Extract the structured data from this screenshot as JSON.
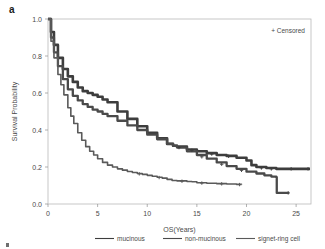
{
  "figure": {
    "panel_label": "a",
    "censored_note": "+ Censored"
  },
  "chart_data": {
    "type": "line",
    "subtype": "kaplan-meier-survival",
    "title": "",
    "xlabel": "OS(Years)",
    "ylabel": "Survival Probability",
    "xlim": [
      0,
      26.5
    ],
    "ylim": [
      0.0,
      1.0
    ],
    "xticks": [
      0,
      5,
      10,
      15,
      20,
      25
    ],
    "xtick_labels": [
      "0",
      "5",
      "10",
      "15",
      "20",
      "25"
    ],
    "yticks": [
      0.0,
      0.2,
      0.4,
      0.6,
      0.8,
      1.0
    ],
    "ytick_labels": [
      "0.0",
      "0.2",
      "0.4",
      "0.6",
      "0.8",
      "1.0"
    ],
    "grid": false,
    "legend_position": "bottom",
    "censor_marker": "+",
    "series": [
      {
        "name": "mucinous",
        "color": "#3d3d3d",
        "x": [
          0,
          0.3,
          0.6,
          1.0,
          1.5,
          2.0,
          2.5,
          3.0,
          3.5,
          4.0,
          4.5,
          5.0,
          5.5,
          6.0,
          7.0,
          8.0,
          9.0,
          10.0,
          11.0,
          12.0,
          12.6,
          13.0,
          14.0,
          15.0,
          16.0,
          17.0,
          18.0,
          19.0,
          20.0,
          20.5,
          21.0,
          22.0,
          23.0,
          24.0,
          25.0,
          26.0,
          26.4
        ],
        "y": [
          1.0,
          0.93,
          0.86,
          0.79,
          0.73,
          0.69,
          0.66,
          0.63,
          0.61,
          0.6,
          0.59,
          0.58,
          0.565,
          0.55,
          0.5,
          0.46,
          0.42,
          0.385,
          0.355,
          0.325,
          0.315,
          0.31,
          0.295,
          0.285,
          0.275,
          0.265,
          0.26,
          0.25,
          0.235,
          0.21,
          0.2,
          0.195,
          0.19,
          0.19,
          0.19,
          0.19,
          0.19
        ]
      },
      {
        "name": "non-mucinous",
        "color": "#4a4a4a",
        "x": [
          0,
          0.3,
          0.6,
          1.0,
          1.5,
          2.0,
          2.5,
          3.0,
          3.5,
          4.0,
          4.5,
          5.0,
          5.5,
          6.0,
          7.0,
          8.0,
          9.0,
          10.0,
          11.0,
          12.0,
          12.6,
          13.0,
          14.0,
          15.0,
          16.0,
          17.0,
          18.0,
          19.0,
          20.0,
          21.0,
          21.8,
          22.5,
          23.0,
          23.05,
          24.0,
          24.3
        ],
        "y": [
          1.0,
          0.9,
          0.82,
          0.745,
          0.675,
          0.62,
          0.585,
          0.56,
          0.54,
          0.525,
          0.51,
          0.5,
          0.487,
          0.475,
          0.45,
          0.425,
          0.4,
          0.375,
          0.35,
          0.325,
          0.315,
          0.305,
          0.285,
          0.265,
          0.245,
          0.225,
          0.205,
          0.19,
          0.175,
          0.165,
          0.155,
          0.148,
          0.145,
          0.06,
          0.06,
          0.06
        ]
      },
      {
        "name": "signet-ring cell",
        "color": "#5a5a5a",
        "x": [
          0,
          0.3,
          0.6,
          1.0,
          1.3,
          1.6,
          2.0,
          2.3,
          2.6,
          3.0,
          3.4,
          3.8,
          4.2,
          4.6,
          5.0,
          5.5,
          6.0,
          6.5,
          7.0,
          7.5,
          8.0,
          8.5,
          9.0,
          9.5,
          10.0,
          10.5,
          11.0,
          11.5,
          12.0,
          12.5,
          13.0,
          14.0,
          14.5,
          15.0,
          16.0,
          17.0,
          18.0,
          19.0,
          19.5
        ],
        "y": [
          1.0,
          0.88,
          0.79,
          0.7,
          0.645,
          0.59,
          0.52,
          0.475,
          0.435,
          0.385,
          0.345,
          0.31,
          0.285,
          0.265,
          0.245,
          0.225,
          0.21,
          0.2,
          0.19,
          0.183,
          0.176,
          0.17,
          0.165,
          0.16,
          0.155,
          0.15,
          0.145,
          0.14,
          0.133,
          0.127,
          0.125,
          0.122,
          0.12,
          0.115,
          0.112,
          0.11,
          0.108,
          0.106,
          0.105
        ]
      }
    ],
    "censored_points": [
      {
        "series": "mucinous",
        "x": 13.2,
        "y": 0.305
      },
      {
        "series": "mucinous",
        "x": 14.5,
        "y": 0.29
      },
      {
        "series": "mucinous",
        "x": 16.5,
        "y": 0.27
      },
      {
        "series": "mucinous",
        "x": 18.2,
        "y": 0.258
      },
      {
        "series": "mucinous",
        "x": 21.5,
        "y": 0.195
      },
      {
        "series": "mucinous",
        "x": 22.5,
        "y": 0.19
      },
      {
        "series": "mucinous",
        "x": 24.5,
        "y": 0.19
      },
      {
        "series": "mucinous",
        "x": 26.2,
        "y": 0.19
      },
      {
        "series": "non-mucinous",
        "x": 15.5,
        "y": 0.255
      },
      {
        "series": "non-mucinous",
        "x": 17.5,
        "y": 0.215
      },
      {
        "series": "non-mucinous",
        "x": 19.5,
        "y": 0.182
      },
      {
        "series": "non-mucinous",
        "x": 24.2,
        "y": 0.06
      },
      {
        "series": "signet-ring cell",
        "x": 9.2,
        "y": 0.163
      },
      {
        "series": "signet-ring cell",
        "x": 11.2,
        "y": 0.143
      },
      {
        "series": "signet-ring cell",
        "x": 13.5,
        "y": 0.123
      },
      {
        "series": "signet-ring cell",
        "x": 15.5,
        "y": 0.113
      },
      {
        "series": "signet-ring cell",
        "x": 17.5,
        "y": 0.109
      },
      {
        "series": "signet-ring cell",
        "x": 19.3,
        "y": 0.105
      }
    ],
    "legend": [
      {
        "label": "mucinous",
        "color": "#3d3d3d"
      },
      {
        "label": "non-mucinous",
        "color": "#4a4a4a"
      },
      {
        "label": "signet-ring cell",
        "color": "#5a5a5a"
      }
    ]
  }
}
